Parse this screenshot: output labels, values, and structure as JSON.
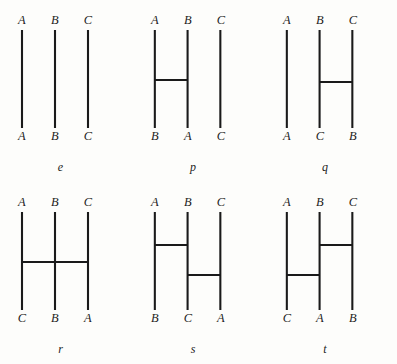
{
  "figure": {
    "title": "",
    "stroke_color": "#1a1a1a",
    "background_color": "#fdfdfb",
    "columns": 3,
    "rows": 2,
    "strand_count": 3,
    "strand_x": [
      22,
      55,
      88
    ],
    "strand_top_y": 30,
    "strand_bottom_y": 128,
    "diagrams": [
      {
        "caption": "e",
        "top_labels": [
          "A",
          "B",
          "C"
        ],
        "bottom_labels": [
          "A",
          "B",
          "C"
        ],
        "bars": []
      },
      {
        "caption": "p",
        "top_labels": [
          "A",
          "B",
          "C"
        ],
        "bottom_labels": [
          "B",
          "A",
          "C"
        ],
        "bars": [
          {
            "from_strand": 1,
            "to_strand": 2,
            "y": 80
          }
        ]
      },
      {
        "caption": "q",
        "top_labels": [
          "A",
          "B",
          "C"
        ],
        "bottom_labels": [
          "A",
          "C",
          "B"
        ],
        "bars": [
          {
            "from_strand": 2,
            "to_strand": 3,
            "y": 82
          }
        ]
      },
      {
        "caption": "r",
        "top_labels": [
          "A",
          "B",
          "C"
        ],
        "bottom_labels": [
          "C",
          "B",
          "A"
        ],
        "bars": [
          {
            "from_strand": 1,
            "to_strand": 3,
            "y": 80
          }
        ]
      },
      {
        "caption": "s",
        "top_labels": [
          "A",
          "B",
          "C"
        ],
        "bottom_labels": [
          "B",
          "C",
          "A"
        ],
        "bars": [
          {
            "from_strand": 1,
            "to_strand": 2,
            "y": 63
          },
          {
            "from_strand": 2,
            "to_strand": 3,
            "y": 93
          }
        ]
      },
      {
        "caption": "t",
        "top_labels": [
          "A",
          "B",
          "C"
        ],
        "bottom_labels": [
          "C",
          "A",
          "B"
        ],
        "bars": [
          {
            "from_strand": 2,
            "to_strand": 3,
            "y": 63
          },
          {
            "from_strand": 1,
            "to_strand": 2,
            "y": 93
          }
        ]
      }
    ]
  }
}
